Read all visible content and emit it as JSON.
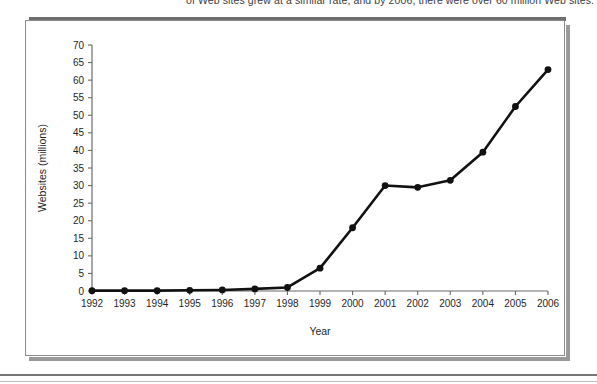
{
  "caption": {
    "text": "of Web sites grew at a similar rate, and by 2006, there were over 60 million Web sites."
  },
  "chart_data": {
    "type": "line",
    "title": "",
    "xlabel": "Year",
    "ylabel": "Websites (millions)",
    "categories": [
      "1992",
      "1993",
      "1994",
      "1995",
      "1996",
      "1997",
      "1998",
      "1999",
      "2000",
      "2001",
      "2002",
      "2003",
      "2004",
      "2005",
      "2006"
    ],
    "values": [
      0.1,
      0.1,
      0.1,
      0.2,
      0.3,
      0.6,
      1.0,
      6.5,
      18.0,
      30.0,
      29.5,
      31.5,
      39.5,
      52.5,
      63.0
    ],
    "series": [
      {
        "name": "Websites",
        "values": [
          0.1,
          0.1,
          0.1,
          0.2,
          0.3,
          0.6,
          1.0,
          6.5,
          18.0,
          30.0,
          29.5,
          31.5,
          39.5,
          52.5,
          63.0
        ]
      }
    ],
    "ylim": [
      0,
      70
    ],
    "yticks": [
      0,
      5,
      10,
      15,
      20,
      25,
      30,
      35,
      40,
      45,
      50,
      55,
      60,
      65,
      70
    ],
    "ytick_labels": [
      "0",
      "5",
      "10",
      "15",
      "20",
      "25",
      "30",
      "35",
      "40",
      "45",
      "50",
      "55",
      "60",
      "65",
      "70"
    ],
    "xtick_labels": [
      "1992",
      "1993",
      "1994",
      "1995",
      "1996",
      "1997",
      "1998",
      "1999",
      "2000",
      "2001",
      "2002",
      "2003",
      "2004",
      "2005",
      "2006"
    ],
    "grid": false,
    "legend": "none",
    "marker": "circle",
    "line_color": "#111111",
    "marker_color": "#111111",
    "axis_color": "#6b6b6b",
    "background": "#ffffff"
  }
}
